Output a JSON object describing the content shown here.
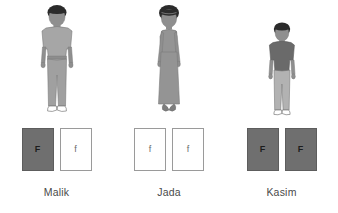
{
  "diagram": {
    "title_visible": false,
    "background_color": "#ffffff",
    "people": [
      {
        "id": "malik",
        "name": "Malik",
        "figure": {
          "icon": "standing-boy-figure",
          "hair_color": "#2b2b2b",
          "skin_color": "#8f8f8f",
          "shirt_color": "#a6a6a6",
          "pants_color": "#a0a0a0",
          "shoe_color": "#ffffff",
          "outline_color": "#7a7a7a"
        },
        "alleles": [
          {
            "symbol": "F",
            "type": "dominant",
            "card_fill": "#6f6f6f",
            "text_color": "#1c1c1c"
          },
          {
            "symbol": "f",
            "type": "recessive",
            "card_fill": "#ffffff",
            "text_color": "#6b6b6b"
          }
        ]
      },
      {
        "id": "jada",
        "name": "Jada",
        "figure": {
          "icon": "standing-girl-dress-figure",
          "hair_color": "#2b2b2b",
          "skin_color": "#8f8f8f",
          "dress_color": "#949494",
          "shoe_color": "#7d7d7d",
          "outline_color": "#7a7a7a"
        },
        "alleles": [
          {
            "symbol": "f",
            "type": "recessive",
            "card_fill": "#ffffff",
            "text_color": "#6b6b6b"
          },
          {
            "symbol": "f",
            "type": "recessive",
            "card_fill": "#ffffff",
            "text_color": "#6b6b6b"
          }
        ]
      },
      {
        "id": "kasim",
        "name": "Kasim",
        "figure": {
          "icon": "standing-child-figure",
          "hair_color": "#2b2b2b",
          "skin_color": "#8f8f8f",
          "shirt_color": "#6a6a6a",
          "pants_color": "#b2b2b2",
          "shoe_color": "#ffffff",
          "outline_color": "#7a7a7a"
        },
        "alleles": [
          {
            "symbol": "F",
            "type": "dominant",
            "card_fill": "#6f6f6f",
            "text_color": "#1c1c1c"
          },
          {
            "symbol": "F",
            "type": "dominant",
            "card_fill": "#6f6f6f",
            "text_color": "#1c1c1c"
          }
        ]
      }
    ]
  }
}
